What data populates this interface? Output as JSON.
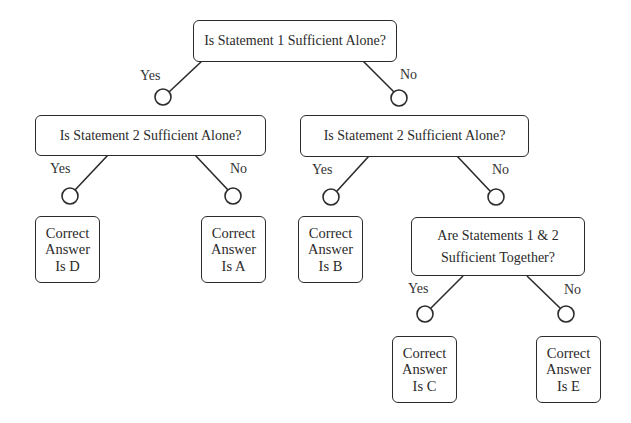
{
  "diagram": {
    "type": "decision-tree",
    "colors": {
      "stroke": "#2b2b2b",
      "text": "#2a2a2a",
      "background": "#ffffff"
    },
    "nodes": {
      "q_root": {
        "text": "Is Statement 1 Sufficient Alone?"
      },
      "q_left": {
        "text": "Is Statement 2 Sufficient Alone?"
      },
      "q_right": {
        "text": "Is Statement 2 Sufficient Alone?"
      },
      "q_together": {
        "line1": "Are Statements 1 & 2",
        "line2": "Sufficient Together?"
      },
      "ans_d": {
        "line1": "Correct",
        "line2": "Answer",
        "line3": "Is D"
      },
      "ans_a": {
        "line1": "Correct",
        "line2": "Answer",
        "line3": "Is A"
      },
      "ans_b": {
        "line1": "Correct",
        "line2": "Answer",
        "line3": "Is B"
      },
      "ans_c": {
        "line1": "Correct",
        "line2": "Answer",
        "line3": "Is C"
      },
      "ans_e": {
        "line1": "Correct",
        "line2": "Answer",
        "line3": "Is E"
      }
    },
    "edges": [
      {
        "from": "q_root",
        "to": "q_left",
        "label": "Yes"
      },
      {
        "from": "q_root",
        "to": "q_right",
        "label": "No"
      },
      {
        "from": "q_left",
        "to": "ans_d",
        "label": "Yes"
      },
      {
        "from": "q_left",
        "to": "ans_a",
        "label": "No"
      },
      {
        "from": "q_right",
        "to": "ans_b",
        "label": "Yes"
      },
      {
        "from": "q_right",
        "to": "q_together",
        "label": "No"
      },
      {
        "from": "q_together",
        "to": "ans_c",
        "label": "Yes"
      },
      {
        "from": "q_together",
        "to": "ans_e",
        "label": "No"
      }
    ]
  }
}
